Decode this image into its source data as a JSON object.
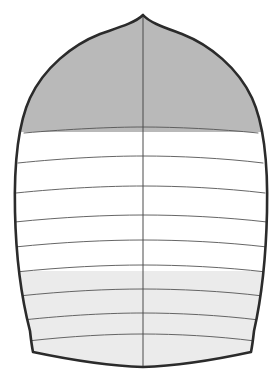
{
  "diagram": {
    "title": "Spinnaker sail panel layout",
    "view": "front elevation",
    "canvas": {
      "width": 275,
      "height": 385,
      "background": "#ffffff"
    },
    "colors": {
      "outline": "#2b2b2b",
      "seam": "#555555",
      "center_seam": "#4a4a4a",
      "panel_dark_gray": "#b9b9b9",
      "panel_white": "#ffffff",
      "panel_light_gray": "#ebebeb"
    },
    "stroke_widths": {
      "outline": 2.6,
      "seam": 0.9,
      "center_seam": 1.0
    },
    "geometry": {
      "head_point": {
        "x": 143,
        "y": 15
      },
      "left_clew": {
        "x": 33,
        "y": 352
      },
      "right_clew": {
        "x": 251,
        "y": 352
      },
      "foot_lowest": {
        "x": 143,
        "y": 367
      },
      "max_width_left_x": 14,
      "max_width_right_x": 267,
      "max_width_y": 245,
      "center_seam_x": 143
    },
    "outline_path": "M143,15 C150,23 166,28 182,34 C210,45 238,68 252,98 C264,124 268,168 267,212 C266,258 261,300 254,331 C253,340 252,347 251,352 C214,360 176,366 143,367 C110,366 71,360 33,352 C32,347 31,340 30,331 C22,300 16,258 15,212 C14,168 18,124 30,98 C44,68 72,45 100,34 C117,28 135,23 143,15 Z",
    "seams": [
      {
        "index": 1,
        "label": "seam-1",
        "path": "M24,133 C70,129 112,127 143,127 C176,127 219,129 258,133"
      },
      {
        "index": 2,
        "label": "seam-2",
        "path": "M18,163 C66,158 110,156 143,156 C178,156 222,158 263,163"
      },
      {
        "index": 3,
        "label": "seam-3",
        "path": "M16,193 C64,188 109,186 143,186 C179,186 223,188 265,193"
      },
      {
        "index": 4,
        "label": "seam-4",
        "path": "M15,222 C63,217 108,215 143,215 C180,215 224,217 267,222"
      },
      {
        "index": 5,
        "label": "seam-5",
        "path": "M15,247 C63,242 108,240 143,240 C180,240 224,242 267,247"
      },
      {
        "index": 6,
        "label": "seam-6",
        "path": "M16,272 C64,267 108,265 143,265 C179,265 224,267 266,272"
      },
      {
        "index": 7,
        "label": "seam-7",
        "path": "M19,296 C66,291 109,289 143,289 C178,289 222,291 263,296"
      },
      {
        "index": 8,
        "label": "seam-8",
        "path": "M23,320 C69,315 111,313 143,313 C176,313 219,315 259,320"
      },
      {
        "index": 9,
        "label": "seam-9",
        "path": "M28,341 C72,336 112,334 143,334 C175,334 216,336 255,341"
      }
    ],
    "panels": [
      {
        "index": 1,
        "label": "head-panel-upper",
        "fill": "panel_dark_gray",
        "top_seam": "head",
        "bottom_seam": "seam-1"
      },
      {
        "index": 2,
        "label": "panel-2",
        "fill": "panel_white",
        "top_seam": "seam-1",
        "bottom_seam": "seam-2"
      },
      {
        "index": 3,
        "label": "panel-3",
        "fill": "panel_white",
        "top_seam": "seam-2",
        "bottom_seam": "seam-3"
      },
      {
        "index": 4,
        "label": "panel-4",
        "fill": "panel_white",
        "top_seam": "seam-3",
        "bottom_seam": "seam-4"
      },
      {
        "index": 5,
        "label": "panel-5",
        "fill": "panel_white",
        "top_seam": "seam-4",
        "bottom_seam": "seam-5"
      },
      {
        "index": 6,
        "label": "panel-6",
        "fill": "panel_white",
        "top_seam": "seam-5",
        "bottom_seam": "seam-6"
      },
      {
        "index": 7,
        "label": "panel-7",
        "fill": "panel_light_gray",
        "top_seam": "seam-6",
        "bottom_seam": "seam-7"
      },
      {
        "index": 8,
        "label": "panel-8",
        "fill": "panel_light_gray",
        "top_seam": "seam-7",
        "bottom_seam": "seam-8"
      },
      {
        "index": 9,
        "label": "panel-9",
        "fill": "panel_light_gray",
        "top_seam": "seam-8",
        "bottom_seam": "seam-9"
      },
      {
        "index": 10,
        "label": "foot-panel",
        "fill": "panel_light_gray",
        "top_seam": "seam-9",
        "bottom_seam": "foot"
      }
    ],
    "center_seam_path": "M143,15 L143,367",
    "panel_count": 10,
    "seam_count": 9
  }
}
